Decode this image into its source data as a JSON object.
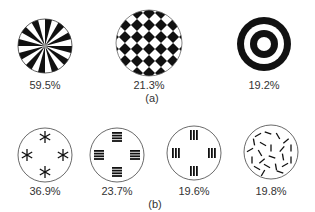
{
  "panel_a": {
    "caption": "(a)",
    "items": [
      {
        "pattern": "radial-sectors",
        "value": "59.5%"
      },
      {
        "pattern": "checkerboard-diamond",
        "value": "21.3%"
      },
      {
        "pattern": "concentric-rings",
        "value": "19.2%"
      }
    ]
  },
  "panel_b": {
    "caption": "(b)",
    "items": [
      {
        "pattern": "four-asterisks",
        "value": "36.9%"
      },
      {
        "pattern": "four-horizontal-bar-groups",
        "value": "23.7%"
      },
      {
        "pattern": "four-vertical-bar-groups",
        "value": "19.6%"
      },
      {
        "pattern": "random-short-lines",
        "value": "19.8%"
      }
    ]
  },
  "colors": {
    "ink": "#111111",
    "outline": "#444444",
    "background": "#ffffff"
  }
}
